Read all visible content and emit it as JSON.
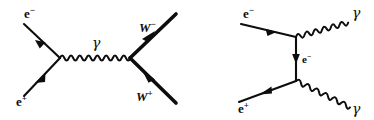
{
  "figure": {
    "background_color": "#ffffff",
    "ink_color": "#0d0d0d",
    "diagram_count": 2
  },
  "diagrams": [
    {
      "id": "ee-to-ww",
      "name": "electron-positron-annihilation-to-W-pair",
      "process": "e- e+ -> gamma -> W- W+",
      "channel": "s-channel",
      "labels": {
        "incoming_top": {
          "base": "e",
          "sup": "−",
          "text": "e−",
          "x": 24,
          "y": 18
        },
        "incoming_bottom": {
          "base": "e",
          "sup": "+",
          "text": "e+",
          "x": 16,
          "y": 106
        },
        "propagator": {
          "text": "γ",
          "x": 92,
          "y": 48
        },
        "outgoing_top": {
          "base": "W",
          "sup": "−",
          "text": "W−",
          "x": 139,
          "y": 32
        },
        "outgoing_bottom": {
          "base": "W",
          "sup": "+",
          "text": "W+",
          "x": 136,
          "y": 101
        }
      },
      "vertices": [
        {
          "name": "left-vertex",
          "x": 60,
          "y": 58
        },
        {
          "name": "right-vertex",
          "x": 130,
          "y": 58
        }
      ],
      "legs": [
        {
          "name": "electron-in-leg",
          "from": [
            24,
            24
          ],
          "to": [
            60,
            58
          ],
          "style": "straight",
          "arrow": "toward-vertex",
          "width": 2.1
        },
        {
          "name": "positron-in-leg",
          "from": [
            60,
            58
          ],
          "to": [
            24,
            96
          ],
          "style": "straight",
          "arrow": "away-from-vertex",
          "width": 2.1
        },
        {
          "name": "photon-propagator",
          "from": [
            60,
            58
          ],
          "to": [
            130,
            58
          ],
          "style": "wavy",
          "arrow": "none",
          "width": 2.0
        },
        {
          "name": "w-minus-out-leg",
          "from": [
            130,
            58
          ],
          "to": [
            176,
            14
          ],
          "style": "straight",
          "arrow": "away-from-vertex",
          "width": 3.6
        },
        {
          "name": "w-plus-out-leg",
          "from": [
            176,
            103
          ],
          "to": [
            130,
            58
          ],
          "style": "straight",
          "arrow": "toward-vertex",
          "width": 3.6
        }
      ]
    },
    {
      "id": "ee-to-gammagamma",
      "name": "electron-positron-annihilation-to-two-photons",
      "process": "e- e+ -> gamma gamma",
      "channel": "t-channel",
      "labels": {
        "incoming_top": {
          "base": "e",
          "sup": "−",
          "text": "e−",
          "x": 243,
          "y": 18
        },
        "incoming_bottom": {
          "base": "e",
          "sup": "+",
          "text": "e+",
          "x": 238,
          "y": 113
        },
        "propagator": {
          "base": "e",
          "sup": "−",
          "text": "e−",
          "x": 302,
          "y": 63
        },
        "outgoing_top": {
          "text": "γ",
          "x": 352,
          "y": 18
        },
        "outgoing_bottom": {
          "text": "γ",
          "x": 352,
          "y": 114
        }
      },
      "vertices": [
        {
          "name": "top-vertex",
          "x": 296,
          "y": 37
        },
        {
          "name": "bottom-vertex",
          "x": 296,
          "y": 81
        }
      ],
      "legs": [
        {
          "name": "electron-in-leg",
          "from": [
            241,
            24
          ],
          "to": [
            296,
            37
          ],
          "style": "straight",
          "arrow": "toward-vertex",
          "width": 2.1
        },
        {
          "name": "electron-propagator",
          "from": [
            296,
            37
          ],
          "to": [
            296,
            81
          ],
          "style": "straight",
          "arrow": "downward",
          "width": 2.1
        },
        {
          "name": "positron-in-leg",
          "from": [
            296,
            81
          ],
          "to": [
            239,
            102
          ],
          "style": "straight",
          "arrow": "away-from-vertex",
          "width": 2.1
        },
        {
          "name": "photon-out-top",
          "from": [
            296,
            37
          ],
          "to": [
            350,
            22
          ],
          "style": "wavy",
          "arrow": "none",
          "width": 2.0
        },
        {
          "name": "photon-out-bottom",
          "from": [
            296,
            81
          ],
          "to": [
            350,
            106
          ],
          "style": "wavy",
          "arrow": "none",
          "width": 2.0
        }
      ]
    }
  ]
}
